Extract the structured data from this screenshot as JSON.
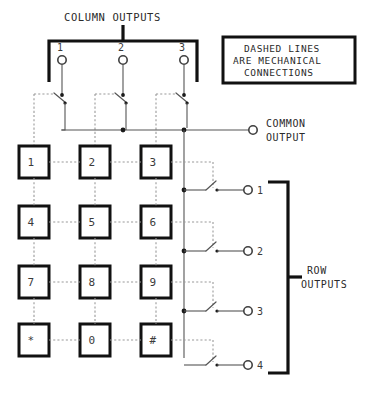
{
  "diagram": {
    "column_outputs_label": "COLUMN OUTPUTS",
    "row_outputs_label_line1": "ROW",
    "row_outputs_label_line2": "OUTPUTS",
    "common_output_label_line1": "COMMON",
    "common_output_label_line2": "OUTPUT",
    "note": {
      "line1": "DASHED LINES",
      "line2": "ARE MECHANICAL",
      "line3": "CONNECTIONS"
    },
    "column_terminals": [
      {
        "number": "1"
      },
      {
        "number": "2"
      },
      {
        "number": "3"
      }
    ],
    "row_terminals": [
      {
        "number": "1"
      },
      {
        "number": "2"
      },
      {
        "number": "3"
      },
      {
        "number": "4"
      }
    ],
    "keypad": {
      "rows": [
        {
          "keys": [
            "1",
            "2",
            "3"
          ]
        },
        {
          "keys": [
            "4",
            "5",
            "6"
          ]
        },
        {
          "keys": [
            "7",
            "8",
            "9"
          ]
        },
        {
          "keys": [
            "*",
            "0",
            "#"
          ]
        }
      ]
    },
    "colors": {
      "ink": "#111111",
      "wire": "#555555",
      "dashed": "#9a9a9a",
      "background": "#ffffff"
    }
  }
}
